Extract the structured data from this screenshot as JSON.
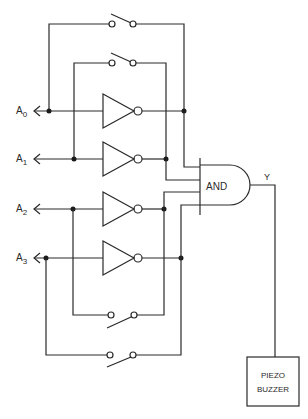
{
  "diagram": {
    "type": "logic-circuit",
    "address_lines": [
      {
        "name": "A",
        "sub": "0"
      },
      {
        "name": "A",
        "sub": "1"
      },
      {
        "name": "A",
        "sub": "2"
      },
      {
        "name": "A",
        "sub": "3"
      }
    ],
    "gate": {
      "label": "AND",
      "output_label": "Y"
    },
    "output_device": {
      "line1": "PIEZO",
      "line2": "BUZZER"
    },
    "components": {
      "switches": 4,
      "inverters": 4,
      "and_gate_inputs": 4
    },
    "colors": {
      "line": "#2a2a2a",
      "background": "#ffffff"
    }
  }
}
